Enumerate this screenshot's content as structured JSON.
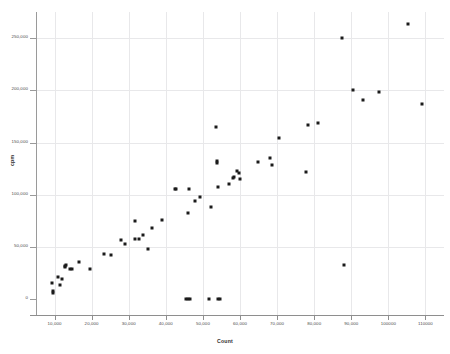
{
  "chart_data": {
    "type": "scatter",
    "title": "",
    "xlabel": "Count",
    "ylabel": "cpm",
    "xlim": [
      5000,
      115000
    ],
    "ylim": [
      -15000,
      275000
    ],
    "grid": true,
    "legend": false,
    "marker_color": "#1b1b1b",
    "x_ticks": [
      10000,
      20000,
      30000,
      40000,
      50000,
      60000,
      70000,
      80000,
      90000,
      100000,
      110000
    ],
    "x_tick_labels": [
      "10,000",
      "20,000",
      "30,000",
      "40,000",
      "50,000",
      "60,000",
      "70,000",
      "80,000",
      "90,000",
      "100000",
      "110000"
    ],
    "y_ticks": [
      0,
      50000,
      100000,
      150000,
      200000,
      250000
    ],
    "y_tick_labels": [
      "0",
      "50,000",
      "100,000",
      "150,000",
      "200,000",
      "250,000"
    ],
    "points": [
      {
        "x": 9200,
        "y": 16000
      },
      {
        "x": 9600,
        "y": 7500
      },
      {
        "x": 9700,
        "y": 6000
      },
      {
        "x": 10900,
        "y": 21000
      },
      {
        "x": 11400,
        "y": 13500
      },
      {
        "x": 12100,
        "y": 19500
      },
      {
        "x": 12700,
        "y": 30500
      },
      {
        "x": 12900,
        "y": 31500
      },
      {
        "x": 13100,
        "y": 32500
      },
      {
        "x": 14100,
        "y": 29000
      },
      {
        "x": 14800,
        "y": 29500
      },
      {
        "x": 16700,
        "y": 35500
      },
      {
        "x": 19500,
        "y": 29000
      },
      {
        "x": 23200,
        "y": 43500
      },
      {
        "x": 25200,
        "y": 42000
      },
      {
        "x": 27800,
        "y": 57000
      },
      {
        "x": 29000,
        "y": 53000
      },
      {
        "x": 31600,
        "y": 74500
      },
      {
        "x": 31800,
        "y": 57500
      },
      {
        "x": 32700,
        "y": 58000
      },
      {
        "x": 33900,
        "y": 62000
      },
      {
        "x": 35200,
        "y": 48500
      },
      {
        "x": 36200,
        "y": 68500
      },
      {
        "x": 39000,
        "y": 75500
      },
      {
        "x": 42400,
        "y": 105500
      },
      {
        "x": 42700,
        "y": 106000
      },
      {
        "x": 45500,
        "y": 0
      },
      {
        "x": 46100,
        "y": 0
      },
      {
        "x": 46400,
        "y": 0
      },
      {
        "x": 45900,
        "y": 83000
      },
      {
        "x": 46200,
        "y": 105500
      },
      {
        "x": 47900,
        "y": 94500
      },
      {
        "x": 49100,
        "y": 97500
      },
      {
        "x": 51600,
        "y": 0
      },
      {
        "x": 54100,
        "y": 0
      },
      {
        "x": 54700,
        "y": 0
      },
      {
        "x": 52200,
        "y": 88500
      },
      {
        "x": 53600,
        "y": 165000
      },
      {
        "x": 53700,
        "y": 132500
      },
      {
        "x": 53800,
        "y": 130500
      },
      {
        "x": 54100,
        "y": 107500
      },
      {
        "x": 56900,
        "y": 110000
      },
      {
        "x": 58100,
        "y": 116500
      },
      {
        "x": 58400,
        "y": 117500
      },
      {
        "x": 59100,
        "y": 123000
      },
      {
        "x": 59600,
        "y": 120500
      },
      {
        "x": 60100,
        "y": 115500
      },
      {
        "x": 64800,
        "y": 131500
      },
      {
        "x": 68000,
        "y": 135500
      },
      {
        "x": 68600,
        "y": 128500
      },
      {
        "x": 70500,
        "y": 154000
      },
      {
        "x": 77700,
        "y": 121500
      },
      {
        "x": 78200,
        "y": 166500
      },
      {
        "x": 80900,
        "y": 168500
      },
      {
        "x": 87600,
        "y": 250500
      },
      {
        "x": 88100,
        "y": 33000
      },
      {
        "x": 90500,
        "y": 200500
      },
      {
        "x": 93100,
        "y": 191000
      },
      {
        "x": 97400,
        "y": 198500
      },
      {
        "x": 105400,
        "y": 263500
      },
      {
        "x": 109000,
        "y": 186500
      }
    ]
  }
}
